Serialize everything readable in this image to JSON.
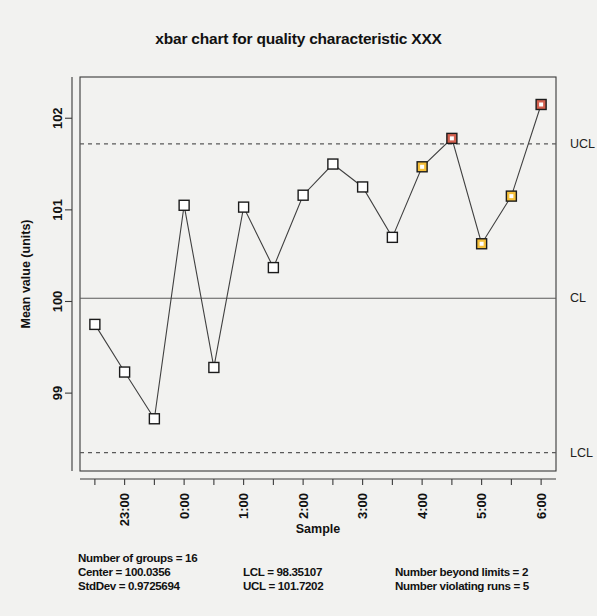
{
  "chart_data": {
    "type": "line",
    "title": "xbar chart for quality characteristic XXX",
    "xlabel": "Sample",
    "ylabel": "Mean value (units)",
    "x": [
      1,
      2,
      3,
      4,
      5,
      6,
      7,
      8,
      9,
      10,
      11,
      12,
      13,
      14,
      15,
      16
    ],
    "values": [
      99.75,
      99.23,
      98.72,
      101.05,
      99.28,
      101.03,
      100.37,
      101.16,
      101.5,
      101.25,
      100.7,
      101.47,
      101.78,
      100.63,
      101.15,
      102.15
    ],
    "point_status": [
      "in-control",
      "in-control",
      "in-control",
      "in-control",
      "in-control",
      "in-control",
      "in-control",
      "in-control",
      "in-control",
      "in-control",
      "in-control",
      "violating-runs",
      "beyond-limits",
      "violating-runs",
      "violating-runs",
      "beyond-limits"
    ],
    "xticklabels": [
      "23:00",
      "0:00",
      "1:00",
      "2:00",
      "3:00",
      "4:00",
      "5:00",
      "6:00"
    ],
    "xtick_at": [
      2,
      4,
      6,
      8,
      10,
      12,
      14,
      16
    ],
    "yticklabels": [
      "99",
      "100",
      "101",
      "102"
    ],
    "ytick_values": [
      99,
      100,
      101,
      102
    ],
    "ylim": [
      98.15,
      102.45
    ],
    "xlim": [
      0.5,
      16.5
    ],
    "grid": false,
    "center": 100.0356,
    "ucl": 101.7202,
    "lcl": 98.35107,
    "limit_labels": {
      "ucl": "UCL",
      "cl": "CL",
      "lcl": "LCL"
    },
    "colors": {
      "in_control": "#ffffff",
      "violating_runs": "#f5c03a",
      "beyond_limits": "#d4604f",
      "marker_edge": "#1b1b1b",
      "line": "#404040",
      "limit_line": "#5a5a5a"
    }
  },
  "stats": {
    "groups": "Number of groups = 16",
    "center": "Center = 100.0356",
    "stddev": "StdDev = 0.9725694",
    "lcl": "LCL = 98.35107",
    "ucl": "UCL = 101.7202",
    "beyond_limits": "Number beyond limits = 2",
    "violating_runs": "Number violating runs = 5"
  }
}
